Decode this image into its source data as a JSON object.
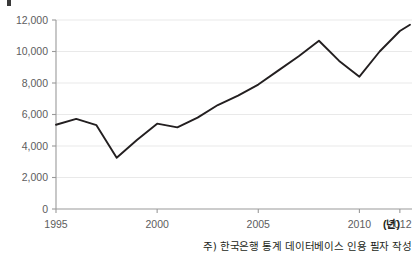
{
  "figure": {
    "footnote": "주) 한국은행 통계 데이터베이스 인용 필자 작성",
    "x_unit_label": "(년)",
    "line_color": "#231f20",
    "axis_color": "#9a9a9a",
    "grid_color": "#e9e9e9",
    "tick_text_color": "#5d5d5d"
  },
  "chart_data": {
    "type": "line",
    "title": "",
    "subtitle": "",
    "xlabel": "(년)",
    "ylabel": "",
    "xlim": [
      1995,
      2012.6
    ],
    "ylim": [
      0,
      12600
    ],
    "grid": true,
    "legend": "none",
    "x_ticks": [
      "1995",
      "2000",
      "2005",
      "2010",
      "2012"
    ],
    "x_tick_values": [
      1995,
      2000,
      2005,
      2010,
      2012
    ],
    "y_ticks": [
      "0",
      "2,000",
      "4,000",
      "6,000",
      "8,000",
      "10,000",
      "12,000"
    ],
    "y_tick_values": [
      0,
      2000,
      4000,
      6000,
      8000,
      10000,
      12000
    ],
    "x": [
      1995,
      1996,
      1997,
      1998,
      1999,
      2000,
      2001,
      2002,
      2003,
      2004,
      2005,
      2006,
      2007,
      2008,
      2009,
      2010,
      2011,
      2012,
      2012.5
    ],
    "values": [
      5350,
      5720,
      5320,
      3250,
      4380,
      5420,
      5180,
      5800,
      6600,
      7200,
      7900,
      8800,
      9700,
      10680,
      9400,
      8400,
      10000,
      11300,
      11700
    ],
    "series": [
      {
        "name": "",
        "values": [
          5350,
          5720,
          5320,
          3250,
          4380,
          5420,
          5180,
          5800,
          6600,
          7200,
          7900,
          8800,
          9700,
          10680,
          9400,
          8400,
          10000,
          11300,
          11700
        ]
      }
    ],
    "annotations": []
  }
}
